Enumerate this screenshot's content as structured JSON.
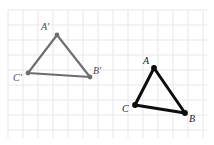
{
  "figure": {
    "width": 214,
    "height": 145,
    "background": "#ffffff"
  },
  "grid": {
    "line_color": "#e7e7ee",
    "spacing": 15,
    "x_start": 8,
    "x_end": 207,
    "y_start": 10,
    "y_end": 138,
    "visible": true
  },
  "shapes": [
    {
      "name": "triangle-image",
      "id": "primed",
      "stroke": "#6d6d6d",
      "stroke_width": 2.1,
      "vertex_dot_radius": 2.4,
      "vertices": [
        {
          "label": "A'",
          "x": 57,
          "y": 35,
          "label_x": 41,
          "label_y": 22
        },
        {
          "label": "B'",
          "x": 90,
          "y": 77,
          "label_x": 93,
          "label_y": 66
        },
        {
          "label": "C'",
          "x": 28,
          "y": 73,
          "label_x": 13,
          "label_y": 73
        }
      ]
    },
    {
      "name": "triangle-preimage",
      "id": "plain",
      "stroke": "#0d0d0d",
      "stroke_width": 3.0,
      "vertex_dot_radius": 2.9,
      "vertices": [
        {
          "label": "A",
          "x": 154,
          "y": 68,
          "label_x": 143,
          "label_y": 56
        },
        {
          "label": "B",
          "x": 185,
          "y": 113,
          "label_x": 189,
          "label_y": 114
        },
        {
          "label": "C",
          "x": 135,
          "y": 105,
          "label_x": 122,
          "label_y": 104
        }
      ]
    }
  ],
  "labels": {
    "font_size": 10,
    "font_style": "italic",
    "color_primed": "#4a4a4a",
    "color_plain": "#1a1a1a"
  }
}
